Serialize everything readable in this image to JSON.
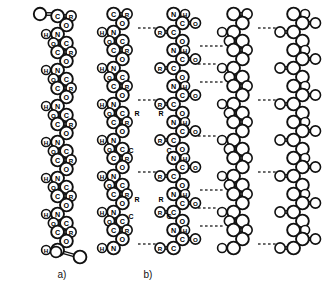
{
  "figure": {
    "background_color": "#ffffff",
    "line_color": "#111111",
    "hbond_color": "#3a3a3a",
    "panels": [
      {
        "id": "a",
        "label": "a)",
        "label_x": 62,
        "label_y": 278,
        "caption_meaning": "single extended polypeptide chain"
      },
      {
        "id": "b",
        "label": "b)",
        "label_x": 148,
        "label_y": 278,
        "caption_meaning": "pleated-sheet of hydrogen bonded polypeptide chains"
      }
    ],
    "atom_labels": [
      "C",
      "O",
      "N",
      "H",
      "R"
    ],
    "bond_types": [
      "single",
      "double",
      "wedge",
      "hydrogen"
    ],
    "chains": [
      {
        "name": "chain-a",
        "panel": "a",
        "labeled": true,
        "x_center": 62,
        "sequence": [
          "O",
          "C",
          "N",
          "C",
          "H",
          "R",
          "C",
          "O",
          "N",
          "C",
          "H",
          "R",
          "C",
          "O",
          "N",
          "C",
          "H",
          "R",
          "C",
          "O"
        ]
      },
      {
        "name": "chain-b1",
        "panel": "b",
        "labeled": true,
        "x_center": 118,
        "sequence": [
          "C",
          "O",
          "N",
          "H",
          "C",
          "R",
          "C",
          "O",
          "N",
          "H",
          "C",
          "R",
          "C",
          "O",
          "N",
          "H",
          "C",
          "R"
        ]
      },
      {
        "name": "chain-b2",
        "panel": "b",
        "labeled": true,
        "x_center": 178,
        "sequence": [
          "O",
          "C",
          "N",
          "H",
          "C",
          "R",
          "C",
          "O",
          "N",
          "H",
          "C",
          "R",
          "C",
          "O",
          "N",
          "H",
          "C",
          "R"
        ]
      },
      {
        "name": "chain-b3",
        "panel": "b",
        "labeled": false,
        "x_center": 238,
        "sequence": []
      },
      {
        "name": "chain-b4",
        "panel": "b",
        "labeled": false,
        "x_center": 298,
        "sequence": []
      }
    ],
    "hydrogen_bonds_count": 12
  }
}
